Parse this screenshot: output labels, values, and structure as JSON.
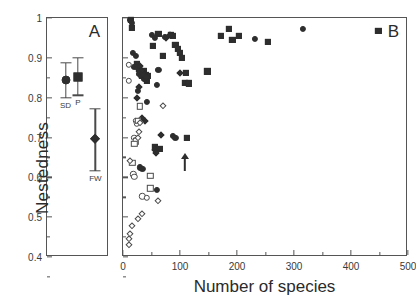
{
  "figure": {
    "ylabel": "Nestedness",
    "xlabel": "Number of species",
    "panelA_letter": "A",
    "panelB_letter": "B"
  },
  "chart_data": [
    {
      "type": "scatter",
      "panel": "A",
      "title": "",
      "xlabel": "",
      "ylabel": "Nestedness",
      "ylim": [
        0.4,
        1.0
      ],
      "yticks": [
        0.4,
        0.5,
        0.6,
        0.7,
        0.8,
        0.9,
        1
      ],
      "ytick_labels": [
        "0.4",
        "0.5",
        "0.6",
        "0.7",
        "0.8",
        "0.9",
        "1"
      ],
      "grid": false,
      "legend": "none",
      "note": "Group means with error bars (standard deviation whiskers)",
      "groups": [
        {
          "name": "SD",
          "label": "SD",
          "marker": "circle",
          "fill": "filled",
          "mean": 0.845,
          "err_low": 0.8,
          "err_high": 0.888,
          "label_pos": "below"
        },
        {
          "name": "P",
          "label": "P",
          "marker": "square",
          "fill": "filled",
          "mean": 0.853,
          "err_low": 0.806,
          "err_high": 0.9,
          "label_pos": "below"
        },
        {
          "name": "FW",
          "label": "FW",
          "marker": "diamond",
          "fill": "filled",
          "mean": 0.695,
          "err_low": 0.616,
          "err_high": 0.772,
          "label_pos": "below"
        }
      ]
    },
    {
      "type": "scatter",
      "panel": "B",
      "title": "",
      "xlabel": "Number of species",
      "ylabel": "",
      "xlim": [
        0,
        500
      ],
      "ylim": [
        0.4,
        1.0
      ],
      "xticks": [
        0,
        100,
        200,
        300,
        400,
        500
      ],
      "xtick_labels": [
        "0",
        "100",
        "200",
        "300",
        "400",
        "500"
      ],
      "xticks_minor": [
        50,
        150,
        250,
        350,
        450
      ],
      "yticks": [
        0.4,
        0.5,
        0.6,
        0.7,
        0.8,
        0.9,
        1
      ],
      "grid": false,
      "legend": "none",
      "annotations": [
        {
          "type": "arrow",
          "direction": "up",
          "x": 108,
          "y": 0.672
        }
      ],
      "series": [
        {
          "name": "filled-square",
          "marker": "square",
          "fill": "filled",
          "points": [
            [
              14,
              0.995
            ],
            [
              16,
              0.975
            ],
            [
              24,
              0.885
            ],
            [
              28,
              0.872
            ],
            [
              30,
              0.862
            ],
            [
              34,
              0.855
            ],
            [
              36,
              0.866
            ],
            [
              38,
              0.849
            ],
            [
              40,
              0.858
            ],
            [
              42,
              0.843
            ],
            [
              44,
              0.855
            ],
            [
              52,
              0.93
            ],
            [
              62,
              0.96
            ],
            [
              70,
              0.905
            ],
            [
              84,
              0.958
            ],
            [
              88,
              0.955
            ],
            [
              92,
              0.932
            ],
            [
              96,
              0.922
            ],
            [
              100,
              0.912
            ],
            [
              104,
              0.9
            ],
            [
              108,
              0.838
            ],
            [
              110,
              0.862
            ],
            [
              112,
              0.7
            ],
            [
              116,
              0.836
            ],
            [
              148,
              0.866
            ],
            [
              172,
              0.955
            ],
            [
              186,
              0.972
            ],
            [
              192,
              0.945
            ],
            [
              204,
              0.955
            ],
            [
              254,
              0.94
            ],
            [
              448,
              0.968
            ],
            [
              56,
              0.676
            ],
            [
              64,
              0.672
            ]
          ]
        },
        {
          "name": "filled-circle",
          "marker": "circle",
          "fill": "filled",
          "points": [
            [
              12,
              0.995
            ],
            [
              16,
              0.988
            ],
            [
              18,
              0.912
            ],
            [
              22,
              0.905
            ],
            [
              20,
              0.878
            ],
            [
              26,
              0.876
            ],
            [
              28,
              0.86
            ],
            [
              30,
              0.872
            ],
            [
              32,
              0.855
            ],
            [
              34,
              0.862
            ],
            [
              36,
              0.848
            ],
            [
              38,
              0.856
            ],
            [
              40,
              0.845
            ],
            [
              26,
              0.816
            ],
            [
              42,
              0.79
            ],
            [
              50,
              0.958
            ],
            [
              56,
              0.95
            ],
            [
              74,
              0.952
            ],
            [
              62,
              0.87
            ],
            [
              60,
              0.833
            ],
            [
              88,
              0.705
            ],
            [
              92,
              0.7
            ],
            [
              232,
              0.948
            ],
            [
              316,
              0.972
            ],
            [
              60,
              0.568
            ],
            [
              30,
              0.625
            ],
            [
              34,
              0.622
            ]
          ]
        },
        {
          "name": "filled-diamond",
          "marker": "diamond",
          "fill": "filled",
          "points": [
            [
              30,
              0.88
            ],
            [
              32,
              0.868
            ],
            [
              36,
              0.858
            ],
            [
              40,
              0.852
            ],
            [
              76,
              0.95
            ],
            [
              82,
              0.958
            ],
            [
              28,
              0.826
            ],
            [
              24,
              0.8
            ],
            [
              100,
              0.862
            ],
            [
              66,
              0.706
            ],
            [
              56,
              0.668
            ],
            [
              58,
              0.66
            ],
            [
              34,
              0.75
            ],
            [
              38,
              0.742
            ]
          ]
        },
        {
          "name": "open-circle",
          "marker": "circle",
          "fill": "open",
          "points": [
            [
              10,
              0.882
            ],
            [
              10,
              0.842
            ],
            [
              22,
              0.742
            ],
            [
              24,
              0.736
            ],
            [
              20,
              0.7
            ],
            [
              22,
              0.694
            ],
            [
              34,
              0.552
            ],
            [
              42,
              0.548
            ],
            [
              18,
              0.608
            ],
            [
              20,
              0.602
            ]
          ]
        },
        {
          "name": "open-square",
          "marker": "square",
          "fill": "open",
          "points": [
            [
              30,
              0.778
            ],
            [
              26,
              0.742
            ],
            [
              22,
              0.69
            ],
            [
              20,
              0.684
            ],
            [
              48,
              0.604
            ],
            [
              48,
              0.572
            ],
            [
              16,
              0.636
            ]
          ]
        },
        {
          "name": "open-diamond",
          "marker": "diamond",
          "fill": "open",
          "points": [
            [
              70,
              0.778
            ],
            [
              30,
              0.736
            ],
            [
              28,
              0.714
            ],
            [
              26,
              0.7
            ],
            [
              12,
              0.64
            ],
            [
              62,
              0.54
            ],
            [
              34,
              0.508
            ],
            [
              26,
              0.496
            ],
            [
              16,
              0.478
            ],
            [
              12,
              0.458
            ],
            [
              10,
              0.446
            ],
            [
              10,
              0.43
            ]
          ]
        }
      ]
    }
  ]
}
